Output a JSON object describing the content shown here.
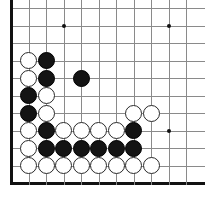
{
  "board": {
    "type": "go-board",
    "title": "Go board position",
    "size": 19,
    "view": {
      "visible_cols": 11,
      "visible_rows": 11,
      "origin_label": "bottom-left corner",
      "left_edge_is_border": true,
      "bottom_edge_is_border": true
    },
    "geometry": {
      "left_px": 11,
      "top_px": 8,
      "spacing_px": 17.5,
      "stone_diameter_px": 17
    },
    "colors": {
      "background": "#ffffff",
      "grid_line": "#8a8a8a",
      "border_line": "#111111",
      "black_stone": "#141414",
      "white_stone": "#ffffff",
      "white_stone_outline": "#2a2a2a",
      "hoshi": "#111111"
    },
    "hoshi_points": [
      {
        "col": 3,
        "row": 1
      },
      {
        "col": 9,
        "row": 1
      },
      {
        "col": 9,
        "row": 7
      }
    ],
    "stones": [
      {
        "color": "white",
        "col": 1,
        "row": 3
      },
      {
        "color": "black",
        "col": 2,
        "row": 3
      },
      {
        "color": "white",
        "col": 1,
        "row": 4
      },
      {
        "color": "black",
        "col": 2,
        "row": 4
      },
      {
        "color": "black",
        "col": 4,
        "row": 4
      },
      {
        "color": "black",
        "col": 1,
        "row": 5
      },
      {
        "color": "white",
        "col": 2,
        "row": 5
      },
      {
        "color": "black",
        "col": 1,
        "row": 6
      },
      {
        "color": "white",
        "col": 2,
        "row": 6
      },
      {
        "color": "white",
        "col": 7,
        "row": 6
      },
      {
        "color": "white",
        "col": 8,
        "row": 6
      },
      {
        "color": "white",
        "col": 1,
        "row": 7
      },
      {
        "color": "black",
        "col": 2,
        "row": 7
      },
      {
        "color": "white",
        "col": 3,
        "row": 7
      },
      {
        "color": "white",
        "col": 4,
        "row": 7
      },
      {
        "color": "white",
        "col": 5,
        "row": 7
      },
      {
        "color": "white",
        "col": 6,
        "row": 7
      },
      {
        "color": "black",
        "col": 7,
        "row": 7
      },
      {
        "color": "white",
        "col": 1,
        "row": 8
      },
      {
        "color": "black",
        "col": 2,
        "row": 8
      },
      {
        "color": "black",
        "col": 3,
        "row": 8
      },
      {
        "color": "black",
        "col": 4,
        "row": 8
      },
      {
        "color": "black",
        "col": 5,
        "row": 8
      },
      {
        "color": "black",
        "col": 6,
        "row": 8
      },
      {
        "color": "black",
        "col": 7,
        "row": 8
      },
      {
        "color": "white",
        "col": 1,
        "row": 9
      },
      {
        "color": "white",
        "col": 2,
        "row": 9
      },
      {
        "color": "white",
        "col": 3,
        "row": 9
      },
      {
        "color": "white",
        "col": 4,
        "row": 9
      },
      {
        "color": "white",
        "col": 5,
        "row": 9
      },
      {
        "color": "white",
        "col": 6,
        "row": 9
      },
      {
        "color": "white",
        "col": 7,
        "row": 9
      },
      {
        "color": "white",
        "col": 8,
        "row": 9
      }
    ]
  }
}
